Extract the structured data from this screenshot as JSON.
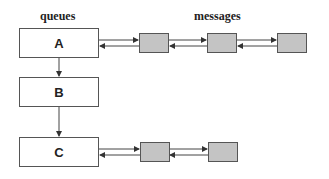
{
  "headers": {
    "queues": "queues",
    "messages": "messages"
  },
  "queues": [
    {
      "label": "A",
      "message_count": 3
    },
    {
      "label": "B",
      "message_count": 0
    },
    {
      "label": "C",
      "message_count": 2
    }
  ],
  "colors": {
    "message_fill": "#c4c4c4",
    "stroke": "#555555",
    "queue_fill": "#ffffff"
  }
}
